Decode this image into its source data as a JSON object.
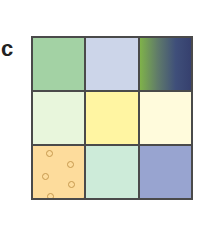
{
  "panel": {
    "label": "c"
  },
  "grid": {
    "rows": 3,
    "cols": 3,
    "cells": [
      {
        "row": 0,
        "col": 0,
        "fill": "#a3d2a4",
        "pattern": "solid"
      },
      {
        "row": 0,
        "col": 1,
        "fill": "#ccd5e9",
        "pattern": "solid"
      },
      {
        "row": 0,
        "col": 2,
        "fill": "linear-gradient(to right, #7fb24a 0%, #5f7a6a 35%, #3f4f7a 70%, #36406e 100%)",
        "pattern": "gradient"
      },
      {
        "row": 1,
        "col": 0,
        "fill": "#e8f6dc",
        "pattern": "solid"
      },
      {
        "row": 1,
        "col": 1,
        "fill": "#fff5a2",
        "pattern": "solid"
      },
      {
        "row": 1,
        "col": 2,
        "fill": "#fffbdc",
        "pattern": "solid"
      },
      {
        "row": 2,
        "col": 0,
        "fill": "#fddc9c",
        "pattern": "circles",
        "circles": [
          [
            13,
            4
          ],
          [
            34,
            15
          ],
          [
            9,
            27
          ],
          [
            35,
            35
          ],
          [
            14,
            47
          ],
          [
            49,
            51
          ]
        ]
      },
      {
        "row": 2,
        "col": 1,
        "fill": "#cdebd9",
        "pattern": "solid"
      },
      {
        "row": 2,
        "col": 2,
        "fill": "#98a4d0",
        "pattern": "solid"
      }
    ]
  }
}
